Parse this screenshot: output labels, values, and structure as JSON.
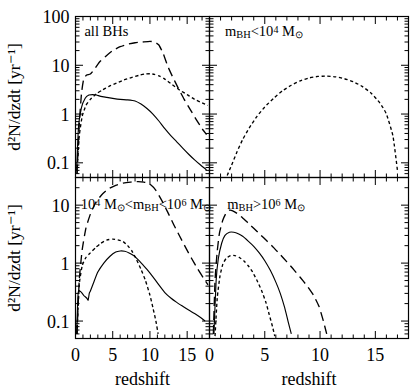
{
  "figure": {
    "axis_labels": {
      "y_top": "d²N/dzdt  [yr⁻¹]",
      "y_bottom": "d²N/dzdt  [yr⁻¹]",
      "x_left": "redshift",
      "x_right": "redshift"
    },
    "colors": {
      "ink": "#000000",
      "background": "#ffffff"
    }
  },
  "chart_data": [
    {
      "type": "line",
      "panel": "top-left",
      "title": "all BHs",
      "xlabel": "redshift",
      "ylabel": "d²N/dzdt  [yr⁻¹]",
      "xlim": [
        0,
        18
      ],
      "ylim": [
        0.05,
        100
      ],
      "yscale": "log",
      "xticks": [
        0,
        5,
        10,
        15
      ],
      "yticks": [
        0.1,
        1,
        10,
        100
      ],
      "ytick_labels": [
        "0.1",
        "1",
        "10",
        "100"
      ],
      "grid": false,
      "legend": "none",
      "series": [
        {
          "name": "long-dash",
          "style": "long-dashed",
          "x": [
            0.2,
            0.5,
            0.8,
            1.1,
            1.5,
            2.0,
            2.6,
            3.2,
            4.0,
            5.0,
            6.0,
            7.0,
            8.0,
            9.0,
            10.0,
            10.6,
            11.2,
            11.8,
            12.4,
            13.0,
            13.8,
            14.6,
            15.4,
            16.2,
            17.0,
            17.6
          ],
          "y": [
            0.06,
            0.6,
            2.6,
            5.2,
            6.3,
            6.6,
            8.5,
            11.5,
            15.0,
            20.0,
            24.0,
            27.0,
            29.0,
            30.0,
            31.0,
            30.0,
            26.0,
            17.0,
            9.5,
            6.0,
            3.4,
            2.0,
            1.25,
            0.78,
            0.5,
            0.38
          ]
        },
        {
          "name": "short-dash",
          "style": "short-dashed",
          "x": [
            0.2,
            0.5,
            0.9,
            1.4,
            2.0,
            2.8,
            3.6,
            4.5,
            5.5,
            6.5,
            7.5,
            8.5,
            9.3,
            10.0,
            10.6,
            11.3,
            12.0,
            13.0,
            14.0,
            15.0,
            16.0,
            17.0,
            17.8
          ],
          "y": [
            0.06,
            0.35,
            0.9,
            1.5,
            2.0,
            2.6,
            3.1,
            3.7,
            4.3,
            5.0,
            5.6,
            6.2,
            6.6,
            6.7,
            6.5,
            6.0,
            5.2,
            4.0,
            3.1,
            2.5,
            2.0,
            1.7,
            1.5
          ]
        },
        {
          "name": "solid",
          "style": "solid",
          "x": [
            0.15,
            0.4,
            0.8,
            1.3,
            1.8,
            2.3,
            2.8,
            3.4,
            4.2,
            5.0,
            6.0,
            7.0,
            8.0,
            8.8,
            9.6,
            10.4,
            11.2,
            12.0,
            12.8,
            13.6,
            14.4,
            15.2,
            16.0,
            16.8,
            17.6
          ],
          "y": [
            0.07,
            0.55,
            1.35,
            2.1,
            2.45,
            2.5,
            2.45,
            2.3,
            2.2,
            2.1,
            2.0,
            1.95,
            1.85,
            1.6,
            1.3,
            1.0,
            0.72,
            0.5,
            0.36,
            0.27,
            0.2,
            0.15,
            0.115,
            0.09,
            0.072
          ]
        }
      ]
    },
    {
      "type": "line",
      "panel": "top-right",
      "title": "m_BH < 10⁴ M_☉",
      "title_parts": {
        "sub": "BH",
        "exp": "4",
        "prefix": "m",
        "relation": "<10",
        "suffix": " M"
      },
      "xlabel": "redshift",
      "xlim": [
        0,
        18
      ],
      "ylim": [
        0.05,
        100
      ],
      "yscale": "log",
      "xticks": [
        0,
        5,
        10,
        15
      ],
      "yticks": [
        0.1,
        1,
        10,
        100
      ],
      "grid": false,
      "legend": "none",
      "series": [
        {
          "name": "short-dash",
          "style": "short-dashed",
          "x": [
            1.6,
            2.0,
            2.5,
            3.0,
            3.6,
            4.3,
            5.0,
            5.8,
            6.6,
            7.4,
            8.2,
            9.0,
            9.8,
            10.6,
            11.4,
            12.2,
            13.0,
            13.8,
            14.6,
            15.4,
            16.0,
            16.6,
            17.0
          ],
          "y": [
            0.055,
            0.09,
            0.17,
            0.3,
            0.52,
            0.9,
            1.4,
            2.1,
            3.0,
            3.9,
            4.8,
            5.5,
            5.9,
            6.0,
            5.8,
            5.3,
            4.6,
            3.7,
            2.7,
            1.7,
            1.0,
            0.35,
            0.07
          ]
        }
      ]
    },
    {
      "type": "line",
      "panel": "bottom-left",
      "title": "10⁴ M_☉ < m_BH < 10⁶ M_☉",
      "xlabel": "redshift",
      "ylabel": "d²N/dzdt  [yr⁻¹]",
      "xlim": [
        0,
        18
      ],
      "ylim": [
        0.05,
        30
      ],
      "yscale": "log",
      "xticks": [
        0,
        5,
        10,
        15
      ],
      "yticks": [
        0.1,
        1,
        10
      ],
      "ytick_labels": [
        "0.1",
        "1",
        "10"
      ],
      "grid": false,
      "legend": "none",
      "series": [
        {
          "name": "long-dash",
          "style": "long-dashed",
          "x": [
            0.2,
            0.5,
            0.9,
            1.4,
            2.0,
            2.7,
            3.5,
            4.4,
            5.4,
            6.4,
            7.4,
            8.4,
            9.2,
            10.0,
            10.8,
            11.6,
            12.4,
            13.2,
            14.0,
            14.8,
            15.6,
            16.4,
            17.2,
            17.8
          ],
          "y": [
            0.06,
            0.5,
            1.7,
            4.0,
            7.0,
            11.0,
            15.0,
            19.0,
            22.0,
            24.0,
            25.0,
            25.5,
            25.0,
            23.0,
            18.0,
            12.0,
            7.5,
            4.6,
            2.9,
            1.85,
            1.2,
            0.8,
            0.55,
            0.42
          ]
        },
        {
          "name": "short-dash",
          "style": "short-dashed",
          "x": [
            0.2,
            0.5,
            0.9,
            1.4,
            2.0,
            2.7,
            3.4,
            4.2,
            5.0,
            5.8,
            6.4,
            7.0,
            7.6,
            8.2,
            8.8,
            9.4,
            10.0,
            10.4,
            10.8,
            11.1
          ],
          "y": [
            0.06,
            0.42,
            0.9,
            1.25,
            1.5,
            1.85,
            2.2,
            2.5,
            2.6,
            2.5,
            2.35,
            2.0,
            1.6,
            1.15,
            0.78,
            0.5,
            0.28,
            0.17,
            0.1,
            0.06
          ]
        },
        {
          "name": "solid",
          "style": "solid",
          "x": [
            0.15,
            0.35,
            0.6,
            0.9,
            1.2,
            1.5,
            1.7,
            1.85,
            2.0,
            2.4,
            3.0,
            3.8,
            4.6,
            5.4,
            6.0,
            6.6,
            7.2,
            7.8,
            8.4,
            9.0,
            9.6,
            10.4,
            11.2,
            12.0,
            12.8,
            13.6,
            14.4,
            15.2,
            16.0,
            16.8,
            17.4
          ],
          "y": [
            0.06,
            0.3,
            0.33,
            0.3,
            0.27,
            0.25,
            0.23,
            0.3,
            0.33,
            0.45,
            0.7,
            1.0,
            1.3,
            1.55,
            1.62,
            1.6,
            1.5,
            1.35,
            1.15,
            0.95,
            0.78,
            0.58,
            0.42,
            0.31,
            0.25,
            0.21,
            0.18,
            0.155,
            0.135,
            0.115,
            0.1
          ]
        }
      ]
    },
    {
      "type": "line",
      "panel": "bottom-right",
      "title": "m_BH > 10⁶ M_☉",
      "xlabel": "redshift",
      "xlim": [
        0,
        18
      ],
      "ylim": [
        0.05,
        30
      ],
      "yscale": "log",
      "xticks": [
        0,
        5,
        10,
        15
      ],
      "yticks": [
        0.1,
        1,
        10
      ],
      "grid": false,
      "legend": "none",
      "series": [
        {
          "name": "long-dash",
          "style": "long-dashed",
          "x": [
            0.35,
            0.5,
            0.7,
            0.9,
            1.2,
            1.5,
            1.8,
            2.1,
            2.5,
            3.0,
            3.5,
            4.0,
            4.6,
            5.2,
            5.8,
            6.4,
            7.0,
            7.6,
            8.2,
            8.8,
            9.4,
            9.9,
            10.3,
            10.6
          ],
          "y": [
            0.06,
            0.5,
            1.6,
            3.3,
            5.5,
            7.3,
            8.2,
            8.0,
            7.2,
            6.0,
            4.9,
            4.0,
            3.1,
            2.4,
            1.85,
            1.4,
            1.05,
            0.78,
            0.57,
            0.41,
            0.28,
            0.18,
            0.1,
            0.06
          ]
        },
        {
          "name": "solid",
          "style": "solid",
          "x": [
            0.4,
            0.6,
            0.8,
            1.1,
            1.4,
            1.8,
            2.2,
            2.6,
            3.0,
            3.5,
            4.0,
            4.5,
            5.0,
            5.5,
            6.0,
            6.4,
            6.8,
            7.1,
            7.4
          ],
          "y": [
            0.06,
            0.5,
            1.2,
            2.2,
            3.0,
            3.4,
            3.4,
            3.2,
            2.9,
            2.4,
            1.95,
            1.5,
            1.1,
            0.75,
            0.47,
            0.3,
            0.17,
            0.1,
            0.06
          ]
        },
        {
          "name": "short-dash",
          "style": "short-dashed",
          "x": [
            0.5,
            0.7,
            0.95,
            1.2,
            1.5,
            1.9,
            2.3,
            2.7,
            3.1,
            3.5,
            3.9,
            4.3,
            4.7,
            5.1,
            5.4,
            5.7,
            5.9
          ],
          "y": [
            0.055,
            0.25,
            0.6,
            0.95,
            1.2,
            1.35,
            1.35,
            1.25,
            1.1,
            0.9,
            0.7,
            0.5,
            0.34,
            0.21,
            0.13,
            0.08,
            0.055
          ]
        }
      ]
    }
  ]
}
